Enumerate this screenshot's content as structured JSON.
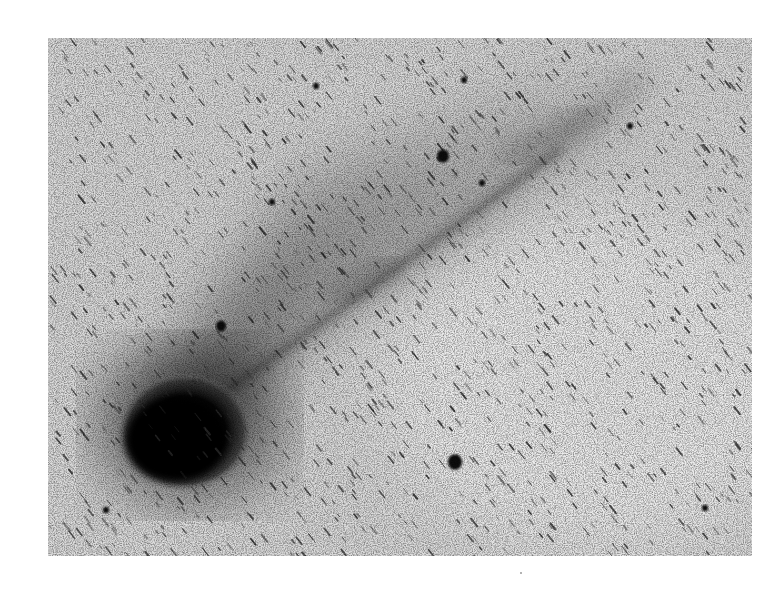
{
  "image": {
    "subject": "comet with long ion tail (negative / inverted astronomical photograph)",
    "style": "inverted grayscale: sky light gray, objects dark",
    "frame": {
      "x": 48,
      "y": 38,
      "width": 704,
      "height": 518
    },
    "colors": {
      "page_background": "#ffffff",
      "sky": "#d6d6d6",
      "coma": "#0a0a0a",
      "tail": "#2a2a2a",
      "star_streaks": "#303030"
    },
    "comet": {
      "head_center": [
        185,
        430
      ],
      "head_radius": 60,
      "tail_end": [
        640,
        80
      ],
      "tail_direction": "toward upper-right"
    },
    "bright_stars": [
      {
        "x": 443,
        "y": 156,
        "r": 6
      },
      {
        "x": 455,
        "y": 462,
        "r": 7
      },
      {
        "x": 221,
        "y": 326,
        "r": 5
      },
      {
        "x": 316,
        "y": 86,
        "r": 3
      },
      {
        "x": 482,
        "y": 183,
        "r": 3
      },
      {
        "x": 106,
        "y": 510,
        "r": 3
      },
      {
        "x": 705,
        "y": 508,
        "r": 3
      },
      {
        "x": 630,
        "y": 126,
        "r": 3
      },
      {
        "x": 272,
        "y": 202,
        "r": 3
      },
      {
        "x": 464,
        "y": 80,
        "r": 3
      }
    ]
  }
}
